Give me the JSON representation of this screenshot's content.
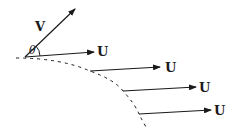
{
  "diagram": {
    "labels": {
      "velocity": "V",
      "angle": "θ",
      "uniform": "U"
    },
    "arrows": [
      {
        "name": "V",
        "x1": 25,
        "y1": 57,
        "x2": 75,
        "y2": 9,
        "label": "V",
        "lx": 36,
        "ly": 30
      },
      {
        "name": "U1",
        "x1": 25,
        "y1": 57,
        "x2": 94,
        "y2": 52,
        "label": "U",
        "lx": 97,
        "ly": 56
      },
      {
        "name": "U2",
        "x1": 90,
        "y1": 71,
        "x2": 160,
        "y2": 67,
        "label": "U",
        "lx": 166,
        "ly": 72
      },
      {
        "name": "U3",
        "x1": 123,
        "y1": 91,
        "x2": 196,
        "y2": 87,
        "label": "U",
        "lx": 199,
        "ly": 92
      },
      {
        "name": "U4",
        "x1": 139,
        "y1": 114,
        "x2": 211,
        "y2": 110,
        "label": "U",
        "lx": 214,
        "ly": 115
      }
    ],
    "colors": {
      "stroke": "#1a1a1a",
      "background": "#ffffff"
    }
  }
}
